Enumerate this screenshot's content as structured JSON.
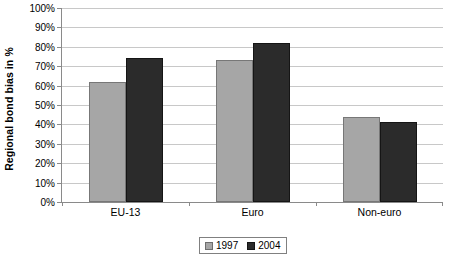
{
  "chart_data": {
    "type": "bar",
    "title": "",
    "xlabel": "",
    "ylabel": "Regional bond bias in %",
    "categories": [
      "EU-13",
      "Euro",
      "Non-euro"
    ],
    "series": [
      {
        "name": "1997",
        "color": "#a6a6a6",
        "values": [
          62,
          73,
          44
        ]
      },
      {
        "name": "2004",
        "color": "#2b2b2b",
        "values": [
          74,
          82,
          41
        ]
      }
    ],
    "ylim": [
      0,
      100
    ],
    "ytick_values": [
      0,
      10,
      20,
      30,
      40,
      50,
      60,
      70,
      80,
      90,
      100
    ],
    "ytick_labels": [
      "0%",
      "10%",
      "20%",
      "30%",
      "40%",
      "50%",
      "60%",
      "70%",
      "80%",
      "90%",
      "100%"
    ],
    "grid": true,
    "legend_position": "bottom",
    "legend_entries": [
      "1997",
      "2004"
    ]
  }
}
